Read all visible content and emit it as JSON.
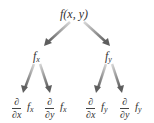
{
  "diagram": {
    "root": {
      "label": "f(x, y)"
    },
    "level1": [
      {
        "label_main": "f",
        "label_sub": "x"
      },
      {
        "label_main": "f",
        "label_sub": "y"
      }
    ],
    "level2": [
      {
        "num": "∂",
        "den_d": "∂",
        "den_var": "x",
        "fn_main": "f",
        "fn_sub": "x"
      },
      {
        "num": "∂",
        "den_d": "∂",
        "den_var": "y",
        "fn_main": "f",
        "fn_sub": "x"
      },
      {
        "num": "∂",
        "den_d": "∂",
        "den_var": "x",
        "fn_main": "f",
        "fn_sub": "y"
      },
      {
        "num": "∂",
        "den_d": "∂",
        "den_var": "y",
        "fn_main": "f",
        "fn_sub": "y"
      }
    ],
    "arrow_color": "#6e6e6e"
  }
}
